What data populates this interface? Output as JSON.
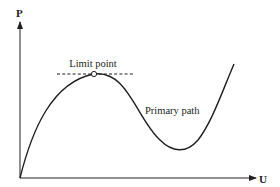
{
  "diagram": {
    "type": "load-displacement curve",
    "axes": {
      "y_label": "P",
      "x_label": "U"
    },
    "annotations": {
      "limit_point": "Limit point",
      "primary_path": "Primary path"
    },
    "colors": {
      "stroke": "#231f20",
      "background": "#ffffff"
    }
  }
}
